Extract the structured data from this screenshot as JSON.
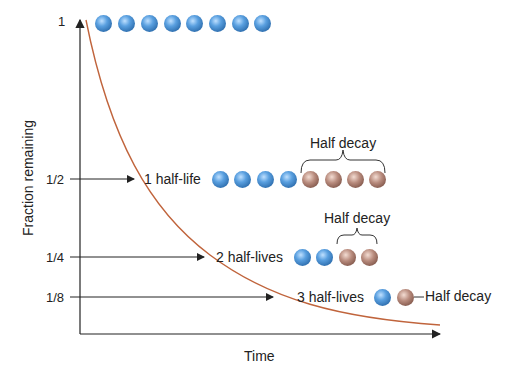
{
  "diagram": {
    "y_axis_label": "Fraction remaining",
    "x_axis_label": "Time",
    "y_ticks": [
      "1",
      "1/2",
      "1/4",
      "1/8"
    ],
    "stages": [
      {
        "label": "",
        "blue": 8,
        "brown": 0
      },
      {
        "label": "1 half-life",
        "blue": 4,
        "brown": 4,
        "decay_label": "Half decay"
      },
      {
        "label": "2 half-lives",
        "blue": 2,
        "brown": 2,
        "decay_label": "Half decay"
      },
      {
        "label": "3 half-lives",
        "blue": 1,
        "brown": 1,
        "decay_label": "Half decay"
      }
    ],
    "colors": {
      "curve": "#c0643c",
      "blue_atom": "#3b7dc4",
      "brown_atom": "#8a5d50",
      "axis": "#222222"
    }
  }
}
